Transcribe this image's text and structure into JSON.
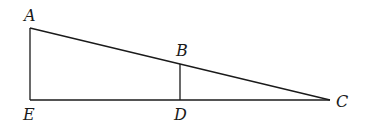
{
  "diagram": {
    "type": "geometry",
    "points": [
      {
        "id": "A",
        "label": "A",
        "x": 30,
        "y": 28,
        "label_x": 24,
        "label_y": 21
      },
      {
        "id": "B",
        "label": "B",
        "x": 180,
        "y": 64,
        "label_x": 176,
        "label_y": 56
      },
      {
        "id": "C",
        "label": "C",
        "x": 330,
        "y": 100,
        "label_x": 336,
        "label_y": 107
      },
      {
        "id": "D",
        "label": "D",
        "x": 180,
        "y": 100,
        "label_x": 174,
        "label_y": 120
      },
      {
        "id": "E",
        "label": "E",
        "x": 30,
        "y": 100,
        "label_x": 23,
        "label_y": 120
      }
    ],
    "segments": [
      {
        "from": "A",
        "to": "C"
      },
      {
        "from": "A",
        "to": "E"
      },
      {
        "from": "E",
        "to": "C"
      },
      {
        "from": "B",
        "to": "D"
      }
    ],
    "colors": {
      "stroke": "#1a1a1a",
      "background": "#ffffff"
    }
  }
}
